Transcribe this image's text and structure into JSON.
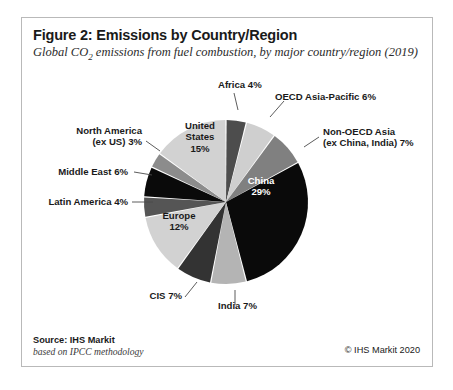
{
  "figure": {
    "title": "Figure 2: Emissions by Country/Region",
    "subtitle_pre": "Global CO",
    "subtitle_sub": "2",
    "subtitle_post": " emissions from fuel combustion, by major country/region (2019)"
  },
  "footer": {
    "source": "Source: IHS Markit",
    "methodology": "based on IPCC methodology",
    "copyright": "© IHS Markit 2020"
  },
  "chart_data": {
    "type": "pie",
    "title": "Figure 2: Emissions by Country/Region",
    "subtitle": "Global CO2 emissions from fuel combustion, by major country/region (2019)",
    "unit": "percent",
    "start_angle_deg": 0,
    "direction": "clockwise",
    "categories": [
      "Africa",
      "OECD Asia-Pacific",
      "Non-OECD Asia (ex China, India)",
      "China",
      "India",
      "CIS",
      "Europe",
      "Latin America",
      "Middle East",
      "North America (ex US)",
      "United States"
    ],
    "values": [
      4,
      6,
      7,
      29,
      7,
      7,
      12,
      4,
      6,
      3,
      15
    ],
    "colors": [
      "#4d4d4d",
      "#cfcfcf",
      "#808080",
      "#0a0a0a",
      "#b4b4b4",
      "#333333",
      "#d2d2d2",
      "#555555",
      "#0a0a0a",
      "#8c8c8c",
      "#d2d2d2"
    ],
    "labels": [
      "Africa 4%",
      "OECD Asia-Pacific 6%",
      "Non-OECD Asia (ex China, India) 7%",
      "China 29%",
      "India 7%",
      "CIS 7%",
      "Europe 12%",
      "Latin America 4%",
      "Middle East 6%",
      "North America (ex US) 3%",
      "United States 15%"
    ],
    "legend": "none",
    "grid": false
  },
  "labels": {
    "africa": "Africa 4%",
    "oecd_asia_pacific": "OECD Asia-Pacific 6%",
    "non_oecd_asia_l1": "Non-OECD Asia",
    "non_oecd_asia_l2": "(ex China, India) 7%",
    "china_l1": "China",
    "china_l2": "29%",
    "india": "India 7%",
    "cis": "CIS 7%",
    "europe_l1": "Europe",
    "europe_l2": "12%",
    "latin_america": "Latin America 4%",
    "middle_east": "Middle East 6%",
    "north_america_l1": "North America",
    "north_america_l2": "(ex US) 3%",
    "united_states_l1": "United",
    "united_states_l2": "States",
    "united_states_l3": "15%"
  }
}
